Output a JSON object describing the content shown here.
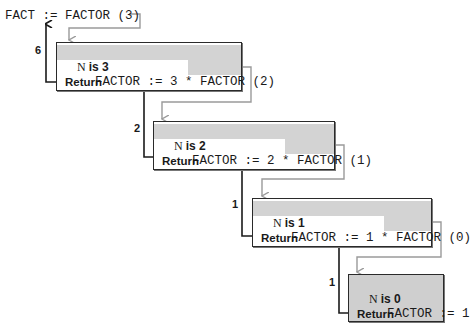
{
  "title_call": "FACT := FACTOR (3)",
  "frames": [
    {
      "n_label": "N",
      "is_label": "is 3",
      "stmt_prefix": "FACTOR := 3 * ",
      "stmt_call": "FACTOR (2)",
      "return_label": "Return",
      "return_value": "6"
    },
    {
      "n_label": "N",
      "is_label": "is 2",
      "stmt_prefix": "FACTOR := 2 * ",
      "stmt_call": "FACTOR (1)",
      "return_label": "Return",
      "return_value": "2"
    },
    {
      "n_label": "N",
      "is_label": "is 1",
      "stmt_prefix": "FACTOR := 1 * ",
      "stmt_call": "FACTOR (0)",
      "return_label": "Return",
      "return_value": "1"
    },
    {
      "n_label": "N",
      "is_label": "is 0",
      "stmt_prefix": "FACTOR := 1",
      "stmt_call": "",
      "return_label": "Return",
      "return_value": "1"
    }
  ],
  "colors": {
    "frame_border": "#2a2a2a",
    "highlight": "#d3d3d3",
    "call_connector": "#9a9a9a",
    "return_arrow": "#1a1a1a"
  }
}
